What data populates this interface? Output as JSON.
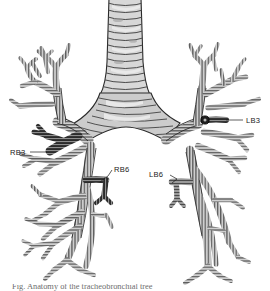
{
  "figure": {
    "background_color": "#ffffff",
    "line_color": "#1a1a1a",
    "cartilage_fill": "#c9c9c9",
    "trachea_fill": "#d6d6d6",
    "highlight_dark": "#2e2e2e",
    "highlight_mid": "#8a8a8a"
  },
  "labels": [
    {
      "id": "RB3",
      "text": "RB3",
      "text_x": 10,
      "text_y": 155,
      "anchor": "start",
      "leader": "M 30 152 L 47 152",
      "side": "right-lung",
      "shade": "dark"
    },
    {
      "id": "LB3",
      "text": "LB3",
      "text_x": 246,
      "text_y": 123,
      "anchor": "start",
      "leader": "M 226 120 L 243 120",
      "side": "left-lung",
      "shade": "dark"
    },
    {
      "id": "RB6",
      "text": "RB6",
      "text_x": 113,
      "text_y": 172,
      "anchor": "start",
      "leader": "M 100 182 L 108 176 L 111 170",
      "side": "right-lung",
      "shade": "dark"
    },
    {
      "id": "LB6",
      "text": "LB6",
      "text_x": 149,
      "text_y": 177,
      "anchor": "start",
      "leader": "M 172 183 L 177 179 L 170 175",
      "side": "left-lung",
      "shade": "mid"
    }
  ],
  "structures": {
    "trachea": "Trachea with stacked cartilage rings",
    "carina": "Main carina bifurcation",
    "right_main_bronchus": "Right main bronchus",
    "left_main_bronchus": "Left main bronchus"
  },
  "caption": {
    "line": "Fig. Anatomy of the tracheobronchial tree"
  }
}
